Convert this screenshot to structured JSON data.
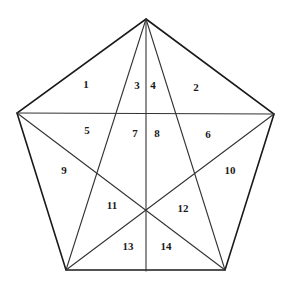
{
  "diagram": {
    "vertices": {
      "top": [
        146,
        19
      ],
      "left": [
        17,
        113
      ],
      "right": [
        274,
        114
      ],
      "bottom_left": [
        66,
        270
      ],
      "bottom_right": [
        225,
        270
      ]
    },
    "center_intersection": [
      146,
      210
    ],
    "bottom_midpoint": [
      146,
      271
    ],
    "regions": [
      {
        "label": "1",
        "x": 86,
        "y": 84
      },
      {
        "label": "2",
        "x": 196,
        "y": 87
      },
      {
        "label": "3",
        "x": 137,
        "y": 85
      },
      {
        "label": "4",
        "x": 153,
        "y": 85
      },
      {
        "label": "5",
        "x": 87,
        "y": 130
      },
      {
        "label": "6",
        "x": 208,
        "y": 134
      },
      {
        "label": "7",
        "x": 135,
        "y": 133
      },
      {
        "label": "8",
        "x": 157,
        "y": 133
      },
      {
        "label": "9",
        "x": 64,
        "y": 170
      },
      {
        "label": "10",
        "x": 230,
        "y": 170
      },
      {
        "label": "11",
        "x": 112,
        "y": 205
      },
      {
        "label": "12",
        "x": 183,
        "y": 208
      },
      {
        "label": "13",
        "x": 128,
        "y": 246
      },
      {
        "label": "14",
        "x": 166,
        "y": 246
      }
    ],
    "colors": {
      "line": "#1a1a1a",
      "background": "#ffffff",
      "text": "#1a1a1a"
    }
  }
}
